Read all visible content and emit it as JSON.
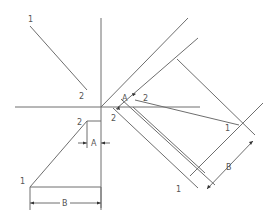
{
  "diagram": {
    "title": "",
    "line_color": "#6e6e6e",
    "text_color": "#555555",
    "labels": {
      "top_line_start": "1",
      "top_line_end": "2",
      "front_view_point2": "2",
      "front_view_point1": "1",
      "front_dim_a": "A",
      "front_dim_b": "B",
      "aux_point2_upper": "2",
      "aux_point2_lower": "2",
      "aux_dim_a": "A",
      "aux_point1": "1",
      "aux_ref_1": "1",
      "aux_dim_b": "B"
    }
  }
}
